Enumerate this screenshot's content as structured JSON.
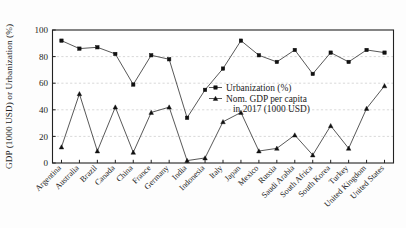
{
  "chart_data": {
    "type": "line",
    "title": "",
    "xlabel": "",
    "ylabel": "GDP (1000 USD) or Urbanization (%)",
    "ylim": [
      0,
      100
    ],
    "yticks": [
      0,
      20,
      40,
      60,
      80,
      100
    ],
    "grid": "horizontal-dashed",
    "legend_position": "center-right-inside",
    "categories": [
      "Argentina",
      "Australia",
      "Brazil",
      "Canada",
      "China",
      "France",
      "Germany",
      "India",
      "Indonesia",
      "Italy",
      "Japan",
      "Mexico",
      "Russia",
      "Saudi Arabia",
      "South Africa",
      "South Korea",
      "Turkey",
      "United Kingdom",
      "United States"
    ],
    "series": [
      {
        "name": "Urbanization (%)",
        "marker": "square",
        "values": [
          92,
          86,
          87,
          82,
          59,
          81,
          78,
          34,
          55,
          71,
          92,
          81,
          76,
          85,
          67,
          83,
          76,
          85,
          83
        ]
      },
      {
        "name": "Nom. GDP per capita in 2017 (1000 USD)",
        "marker": "triangle",
        "values": [
          12,
          52,
          9,
          42,
          8,
          38,
          42,
          1.8,
          3.8,
          31,
          38,
          9,
          11,
          21,
          6,
          28,
          11,
          41,
          58
        ]
      }
    ]
  },
  "legend": {
    "entries": [
      {
        "label": "Urbanization (%)",
        "marker": "square"
      },
      {
        "label_line1": "Nom. GDP per capita",
        "label_line2": "in 2017 (1000 USD)",
        "marker": "triangle"
      }
    ]
  },
  "axes": {
    "y_title": "GDP (1000 USD) or Urbanization (%)",
    "y_tick_labels": [
      "0",
      "20",
      "40",
      "60",
      "80",
      "100"
    ]
  },
  "colors": {
    "series_line": "#3a3a3a",
    "marker": "#111111",
    "grid": "#c9c9c9",
    "axis": "#222222",
    "background": "#fdfdfd"
  }
}
